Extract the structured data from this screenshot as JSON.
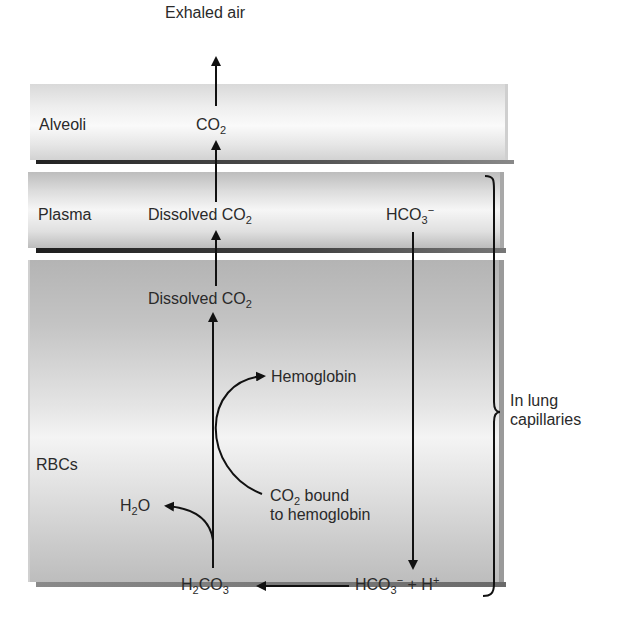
{
  "diagram": {
    "top_label": "Exhaled air",
    "compartments": [
      {
        "id": "alveoli",
        "label": "Alveoli"
      },
      {
        "id": "plasma",
        "label": "Plasma"
      },
      {
        "id": "rbcs",
        "label": "RBCs"
      }
    ],
    "bracket_label_line1": "In lung",
    "bracket_label_line2": "capillaries",
    "species": {
      "alveoli_co2": {
        "base": "CO",
        "sub": "2"
      },
      "plasma_dissolved_co2": {
        "prefix": "Dissolved CO",
        "sub": "2"
      },
      "plasma_bicarbonate": {
        "base": "HCO",
        "sub": "3",
        "sup": "−"
      },
      "rbc_dissolved_co2": {
        "prefix": "Dissolved CO",
        "sub": "2"
      },
      "hemoglobin": "Hemoglobin",
      "co2_bound_line1_base": "CO",
      "co2_bound_line1_sub": "2",
      "co2_bound_line1_rest": " bound",
      "co2_bound_line2": "to hemoglobin",
      "water": {
        "h": "H",
        "sub": "2",
        "o": "O"
      },
      "carbonic_acid": {
        "h": "H",
        "sub1": "2",
        "c": "CO",
        "sub2": "3"
      },
      "bicarbonate_plus_h": {
        "base": "HCO",
        "sub": "3",
        "sup": "−",
        "plus": " + H",
        "sup2": "+"
      }
    },
    "colors": {
      "arrow": "#111111",
      "text": "#2a2a2a",
      "background": "#ffffff"
    }
  }
}
